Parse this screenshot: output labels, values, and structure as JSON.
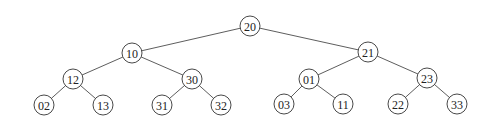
{
  "tree": {
    "nodes": [
      {
        "id": "n20",
        "label": "20",
        "x": 250,
        "y": 26
      },
      {
        "id": "n10",
        "label": "10",
        "x": 132,
        "y": 53
      },
      {
        "id": "n21",
        "label": "21",
        "x": 368,
        "y": 52
      },
      {
        "id": "n12",
        "label": "12",
        "x": 73,
        "y": 79
      },
      {
        "id": "n30",
        "label": "30",
        "x": 192,
        "y": 79
      },
      {
        "id": "n01",
        "label": "01",
        "x": 309,
        "y": 79
      },
      {
        "id": "n23",
        "label": "23",
        "x": 427,
        "y": 78
      },
      {
        "id": "n02",
        "label": "02",
        "x": 44,
        "y": 105
      },
      {
        "id": "n13",
        "label": "13",
        "x": 103,
        "y": 105
      },
      {
        "id": "n31",
        "label": "31",
        "x": 162,
        "y": 105
      },
      {
        "id": "n32",
        "label": "32",
        "x": 221,
        "y": 105
      },
      {
        "id": "n03",
        "label": "03",
        "x": 284,
        "y": 104
      },
      {
        "id": "n11",
        "label": "11",
        "x": 343,
        "y": 104
      },
      {
        "id": "n22",
        "label": "22",
        "x": 398,
        "y": 104
      },
      {
        "id": "n33",
        "label": "33",
        "x": 457,
        "y": 104
      }
    ],
    "edges": [
      [
        "n20",
        "n10"
      ],
      [
        "n20",
        "n21"
      ],
      [
        "n10",
        "n12"
      ],
      [
        "n10",
        "n30"
      ],
      [
        "n21",
        "n01"
      ],
      [
        "n21",
        "n23"
      ],
      [
        "n12",
        "n02"
      ],
      [
        "n12",
        "n13"
      ],
      [
        "n30",
        "n31"
      ],
      [
        "n30",
        "n32"
      ],
      [
        "n01",
        "n03"
      ],
      [
        "n01",
        "n11"
      ],
      [
        "n23",
        "n22"
      ],
      [
        "n23",
        "n33"
      ]
    ]
  }
}
